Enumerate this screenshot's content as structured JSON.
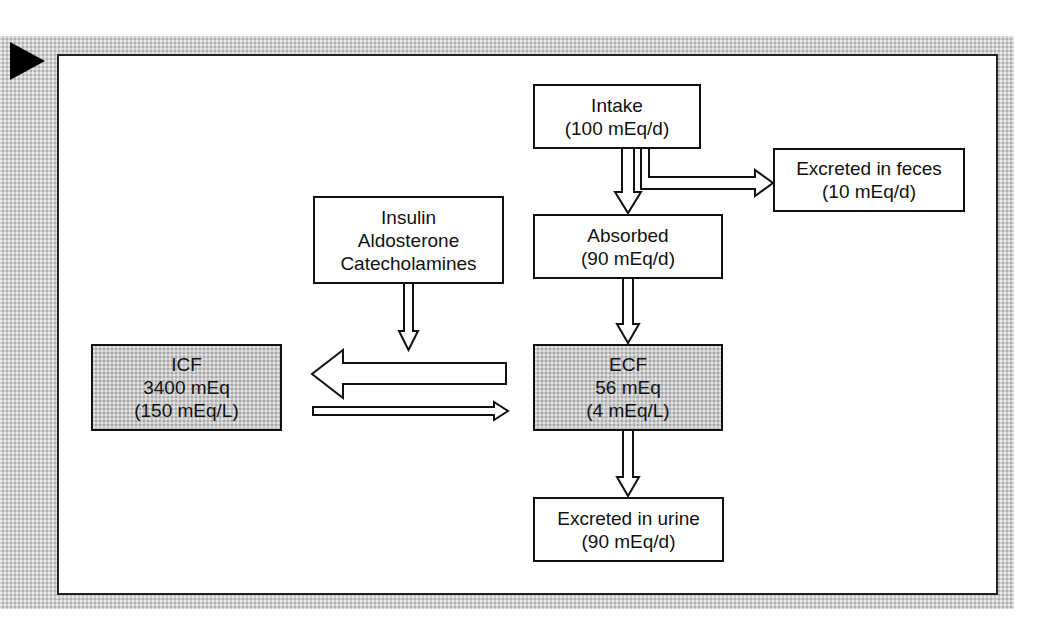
{
  "diagram": {
    "title_marker": "play-triangle",
    "nodes": {
      "intake": {
        "line1": "Intake",
        "line2": "(100 mEq/d)"
      },
      "feces": {
        "line1": "Excreted in feces",
        "line2": "(10 mEq/d)"
      },
      "hormones": {
        "line1": "Insulin",
        "line2": "Aldosterone",
        "line3": "Catecholamines"
      },
      "absorbed": {
        "line1": "Absorbed",
        "line2": "(90 mEq/d)"
      },
      "icf": {
        "line1": "ICF",
        "line2": "3400 mEq",
        "line3": "(150 mEq/L)"
      },
      "ecf": {
        "line1": "ECF",
        "line2": "56 mEq",
        "line3": "(4 mEq/L)"
      },
      "urine": {
        "line1": "Excreted in urine",
        "line2": "(90 mEq/d)"
      }
    },
    "edges": [
      {
        "from": "intake",
        "to": "absorbed",
        "style": "hollow-arrow"
      },
      {
        "from": "intake",
        "to": "feces",
        "style": "hollow-elbow-arrow"
      },
      {
        "from": "absorbed",
        "to": "ecf",
        "style": "hollow-arrow"
      },
      {
        "from": "hormones",
        "to": "icf-ecf-shift",
        "style": "hollow-arrow"
      },
      {
        "from": "ecf",
        "to": "icf",
        "style": "large-hollow-arrow"
      },
      {
        "from": "icf",
        "to": "ecf",
        "style": "thin-hollow-arrow"
      },
      {
        "from": "ecf",
        "to": "urine",
        "style": "hollow-arrow"
      }
    ],
    "colors": {
      "frame": "#cfcfcf",
      "shaded_box": "#c9c9c9",
      "stroke": "#111111",
      "panel": "#ffffff"
    }
  }
}
